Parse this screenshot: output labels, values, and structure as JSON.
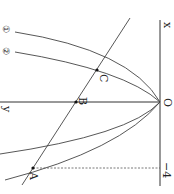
{
  "diagram": {
    "orientation": "rotated-90-clockwise",
    "axes": {
      "x_label": "x",
      "y_label": "y",
      "origin_label": "O"
    },
    "curves": [
      {
        "id": "1",
        "label": "①"
      },
      {
        "id": "2",
        "label": "②"
      }
    ],
    "points": [
      {
        "name": "A",
        "label": "A"
      },
      {
        "name": "B",
        "label": "B"
      },
      {
        "name": "C",
        "label": "C"
      }
    ],
    "tick": {
      "label": "−4"
    },
    "colors": {
      "stroke": "#444444",
      "background": "#ffffff"
    }
  }
}
